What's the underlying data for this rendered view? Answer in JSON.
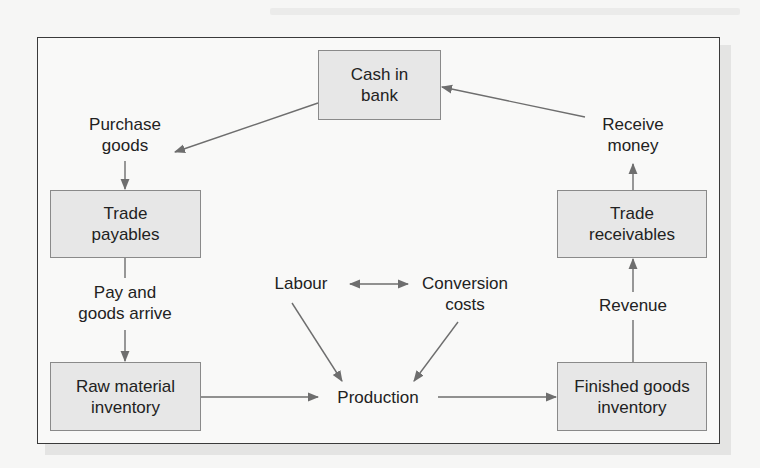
{
  "diagram": {
    "type": "flowchart",
    "title": "",
    "nodes": {
      "cash_in_bank": {
        "line1": "Cash in",
        "line2": "bank",
        "shape": "box"
      },
      "trade_payables": {
        "line1": "Trade",
        "line2": "payables",
        "shape": "box"
      },
      "raw_material_inventory": {
        "line1": "Raw material",
        "line2": "inventory",
        "shape": "box"
      },
      "finished_goods_inventory": {
        "line1": "Finished goods",
        "line2": "inventory",
        "shape": "box"
      },
      "trade_receivables": {
        "line1": "Trade",
        "line2": "receivables",
        "shape": "box"
      },
      "purchase_goods": {
        "line1": "Purchase",
        "line2": "goods",
        "shape": "label"
      },
      "pay_and_goods_arrive": {
        "line1": "Pay and",
        "line2": "goods arrive",
        "shape": "label"
      },
      "production": {
        "line1": "Production",
        "shape": "label"
      },
      "labour": {
        "line1": "Labour",
        "shape": "label"
      },
      "conversion_costs": {
        "line1": "Conversion",
        "line2": "costs",
        "shape": "label"
      },
      "revenue": {
        "line1": "Revenue",
        "shape": "label"
      },
      "receive_money": {
        "line1": "Receive",
        "line2": "money",
        "shape": "label"
      }
    },
    "edges": [
      {
        "from": "Cash in bank",
        "to": "Purchase goods"
      },
      {
        "from": "Purchase goods",
        "to": "Trade payables"
      },
      {
        "from": "Trade payables",
        "to": "Pay and goods arrive"
      },
      {
        "from": "Pay and goods arrive",
        "to": "Raw material inventory"
      },
      {
        "from": "Raw material inventory",
        "to": "Production"
      },
      {
        "from": "Labour",
        "to": "Production"
      },
      {
        "from": "Conversion costs",
        "to": "Production"
      },
      {
        "from": "Labour",
        "to": "Conversion costs",
        "bidirectional": true
      },
      {
        "from": "Production",
        "to": "Finished goods inventory"
      },
      {
        "from": "Finished goods inventory",
        "to": "Revenue"
      },
      {
        "from": "Revenue",
        "to": "Trade receivables"
      },
      {
        "from": "Trade receivables",
        "to": "Receive money"
      },
      {
        "from": "Receive money",
        "to": "Cash in bank"
      }
    ],
    "colors": {
      "box_fill": "#e7e7e7",
      "box_border": "#8a8a8a",
      "arrow": "#6e6e6e",
      "frame_border": "#3a3a3a"
    }
  }
}
